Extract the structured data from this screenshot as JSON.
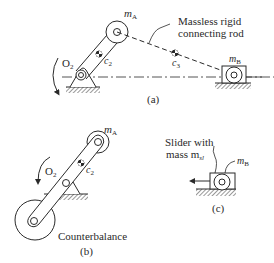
{
  "figure_a": {
    "label": "(a)",
    "mass_A": "m",
    "mass_A_sub": "A",
    "mass_B": "m",
    "mass_B_sub": "B",
    "pivot": "O",
    "pivot_sub": "2",
    "center_crank": "c",
    "center_crank_sub": "2",
    "center_rod": "c",
    "center_rod_sub": "3",
    "rod_label_line1": "Massless rigid",
    "rod_label_line2": "connecting rod"
  },
  "figure_b": {
    "label": "(b)",
    "mass_A": "m",
    "mass_A_sub": "A",
    "pivot": "O",
    "pivot_sub": "2",
    "center_crank": "c",
    "center_crank_sub": "2",
    "counterbalance_label": "Counterbalance"
  },
  "figure_c": {
    "label": "(c)",
    "slider_line1": "Slider with",
    "slider_line2": "mass m",
    "slider_sub": "sl",
    "mass_B": "m",
    "mass_B_sub": "B"
  },
  "colors": {
    "stroke": "#2a2a2a",
    "hatch": "#555555",
    "background": "#ffffff"
  }
}
